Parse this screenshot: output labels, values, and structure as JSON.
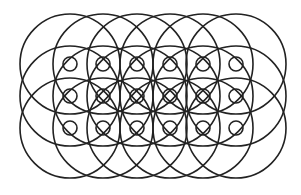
{
  "figure": {
    "stroke_color": "#222222",
    "background_color": "#ffffff",
    "grid_x": [
      70,
      103,
      137,
      170,
      203,
      236
    ],
    "grid_y": [
      64,
      96,
      128
    ],
    "large_radius": 50,
    "small_radius": 7
  }
}
